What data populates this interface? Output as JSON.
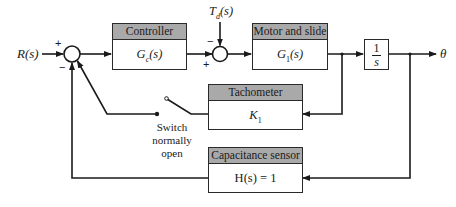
{
  "diagram": {
    "type": "block-diagram",
    "input_label": "R(s)",
    "output_label": "θ",
    "disturbance_label": "T_d(s)",
    "blocks": [
      {
        "id": "controller",
        "title": "Controller",
        "transfer": "G_c(s)"
      },
      {
        "id": "motor",
        "title": "Motor and slide",
        "transfer": "G_1(s)"
      },
      {
        "id": "integrator",
        "title": "",
        "transfer_num": "1",
        "transfer_den": "s"
      },
      {
        "id": "tachometer",
        "title": "Tachometer",
        "transfer": "K_1"
      },
      {
        "id": "sensor",
        "title": "Capacitance sensor",
        "transfer": "H(s) = 1"
      }
    ],
    "junctions": [
      {
        "id": "sum1",
        "signs": {
          "top": "+",
          "bottom": "−"
        }
      },
      {
        "id": "sum2",
        "signs": {
          "top": "−",
          "bottom": "+"
        }
      }
    ],
    "switch": {
      "label_line1": "Switch",
      "label_line2": "normally",
      "label_line3": "open"
    }
  }
}
